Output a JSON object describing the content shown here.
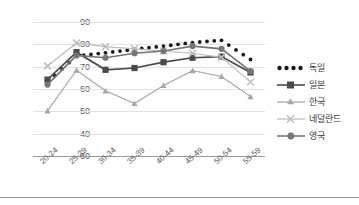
{
  "chart_data": {
    "type": "line",
    "title": "",
    "xlabel": "",
    "ylabel": "",
    "categories": [
      "20-24",
      "25-29",
      "30-34",
      "35-39",
      "40-44",
      "45-49",
      "50-54",
      "55-59"
    ],
    "ylim": [
      30,
      90
    ],
    "yticks": [
      30,
      40,
      50,
      60,
      70,
      80,
      90
    ],
    "grid": true,
    "legend_position": "right",
    "series": [
      {
        "name": "독일",
        "marker": "dotted-circle",
        "color": "#1a1a1a",
        "style": "dotted",
        "values": [
          63.0,
          74.8,
          76.2,
          77.8,
          79.2,
          80.8,
          81.8,
          73.2
        ]
      },
      {
        "name": "일본",
        "marker": "square",
        "color": "#4a4a4a",
        "style": "solid",
        "values": [
          64.2,
          76.5,
          68.6,
          69.4,
          72.0,
          74.0,
          74.5,
          67.4
        ]
      },
      {
        "name": "한국",
        "marker": "triangle",
        "color": "#a8a8a8",
        "style": "solid",
        "values": [
          50.2,
          68.4,
          59.2,
          53.5,
          61.6,
          68.2,
          65.6,
          56.6
        ]
      },
      {
        "name": "네덜란드",
        "marker": "x",
        "color": "#bdbdbd",
        "style": "solid",
        "values": [
          70.3,
          80.6,
          79.0,
          78.0,
          77.0,
          76.0,
          74.2,
          63.2
        ]
      },
      {
        "name": "영국",
        "marker": "circle",
        "color": "#767676",
        "style": "solid",
        "values": [
          62.0,
          75.0,
          74.0,
          76.0,
          77.0,
          79.2,
          78.0,
          68.0
        ]
      }
    ]
  },
  "axes": {
    "ytick_labels": [
      "90",
      "80",
      "70",
      "60",
      "50",
      "40",
      "30"
    ],
    "xtick_labels": [
      "20-24",
      "25-29",
      "30-34",
      "35-39",
      "40-44",
      "45-49",
      "50-54",
      "55-59"
    ]
  },
  "legend": {
    "items": [
      {
        "label": "독일",
        "marker": "dotted-circle"
      },
      {
        "label": "일본",
        "marker": "square"
      },
      {
        "label": "한국",
        "marker": "triangle"
      },
      {
        "label": "네덜란드",
        "marker": "x"
      },
      {
        "label": "영국",
        "marker": "circle"
      }
    ]
  }
}
